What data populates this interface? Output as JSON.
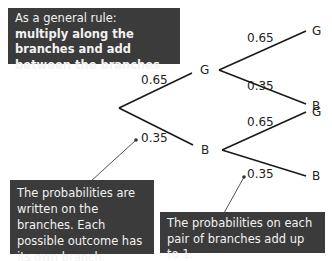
{
  "header_cut_text": "You have a choice of probability trees...",
  "rule_box": {
    "prefix": "As a general rule: ",
    "bold": "multiply along the branches and add between the branches",
    "suffix": "."
  },
  "tree": {
    "first": [
      {
        "outcome": "G",
        "prob": "0.65"
      },
      {
        "outcome": "B",
        "prob": "0.35"
      }
    ],
    "second_after_G": [
      {
        "outcome": "G",
        "prob": "0.65"
      },
      {
        "outcome": "B",
        "prob": "0.35"
      }
    ],
    "second_after_B": [
      {
        "outcome": "G",
        "prob": "0.65"
      },
      {
        "outcome": "B",
        "prob": "0.35"
      }
    ]
  },
  "callouts": {
    "written": "The probabilities are written on the branches. Each possible outcome has its own branch.",
    "pair": "The probabilities on each pair of branches add up to 1."
  }
}
